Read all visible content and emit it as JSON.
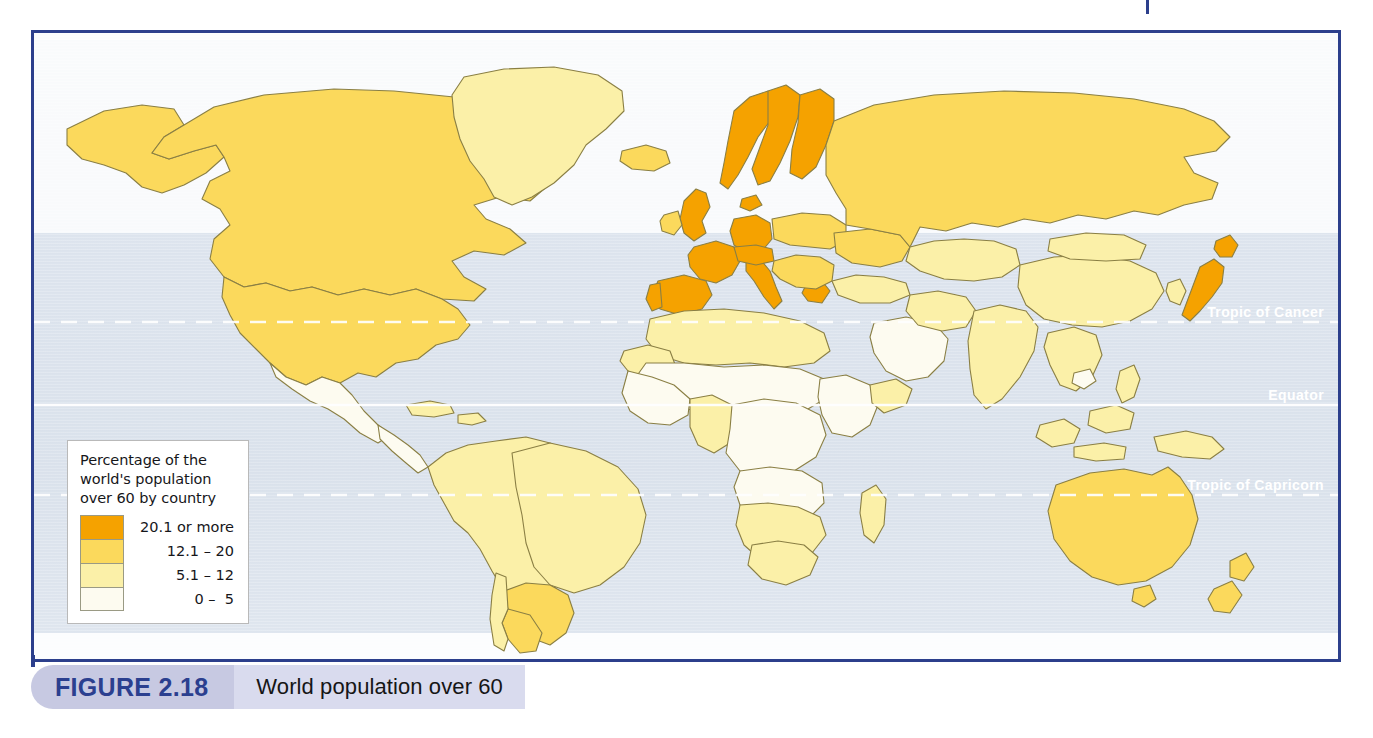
{
  "figure": {
    "number": "FIGURE 2.18",
    "caption": "World population over 60"
  },
  "legend": {
    "title": "Percentage of the world's population over 60 by country",
    "entries": [
      {
        "label": "20.1 or more",
        "color": "#F5A200",
        "min": 20.1,
        "max": null
      },
      {
        "label": "12.1 – 20",
        "color": "#FBD95C",
        "min": 12.1,
        "max": 20
      },
      {
        "label": "5.1 – 12",
        "color": "#FBF0A8",
        "min": 5.1,
        "max": 12
      },
      {
        "label": "0 –  5",
        "color": "#FDFBF0",
        "min": 0,
        "max": 5
      }
    ]
  },
  "map": {
    "type": "choropleth",
    "projection": "world-flat",
    "ocean_color": "#dde4ed",
    "land_stroke": "#8a7f44",
    "frame_color": "#2c3f8c",
    "graticule_labels": [
      {
        "name": "Tropic of Cancer",
        "text": "Tropic of Cancer",
        "style": "dashed"
      },
      {
        "name": "Equator",
        "text": "Equator",
        "style": "solid"
      },
      {
        "name": "Tropic of Capricorn",
        "text": "Tropic of Capricorn",
        "style": "dashed"
      }
    ],
    "regions": [
      {
        "name": "Canada",
        "tier": 1
      },
      {
        "name": "United States",
        "tier": 1
      },
      {
        "name": "Alaska",
        "tier": 1
      },
      {
        "name": "Greenland",
        "tier": 2
      },
      {
        "name": "Iceland",
        "tier": 1
      },
      {
        "name": "Mexico",
        "tier": 3
      },
      {
        "name": "Central America",
        "tier": 3
      },
      {
        "name": "Caribbean",
        "tier": 2
      },
      {
        "name": "Brazil",
        "tier": 2
      },
      {
        "name": "Argentina",
        "tier": 1
      },
      {
        "name": "Uruguay",
        "tier": 1
      },
      {
        "name": "Chile",
        "tier": 2
      },
      {
        "name": "Andean states",
        "tier": 2
      },
      {
        "name": "United Kingdom",
        "tier": 0
      },
      {
        "name": "Ireland",
        "tier": 1
      },
      {
        "name": "France",
        "tier": 0
      },
      {
        "name": "Spain",
        "tier": 0
      },
      {
        "name": "Portugal",
        "tier": 0
      },
      {
        "name": "Italy",
        "tier": 0
      },
      {
        "name": "Germany",
        "tier": 0
      },
      {
        "name": "Sweden",
        "tier": 0
      },
      {
        "name": "Finland",
        "tier": 0
      },
      {
        "name": "Norway",
        "tier": 0
      },
      {
        "name": "Denmark",
        "tier": 0
      },
      {
        "name": "Switzerland",
        "tier": 0
      },
      {
        "name": "Austria",
        "tier": 0
      },
      {
        "name": "Greece",
        "tier": 0
      },
      {
        "name": "Central Europe",
        "tier": 1
      },
      {
        "name": "Balkans",
        "tier": 1
      },
      {
        "name": "Russia",
        "tier": 1
      },
      {
        "name": "Ukraine",
        "tier": 1
      },
      {
        "name": "Turkey",
        "tier": 2
      },
      {
        "name": "North Africa",
        "tier": 2
      },
      {
        "name": "Sub-Saharan Africa",
        "tier": 3
      },
      {
        "name": "South Africa",
        "tier": 2
      },
      {
        "name": "Namibia",
        "tier": 2
      },
      {
        "name": "Botswana",
        "tier": 2
      },
      {
        "name": "Madagascar",
        "tier": 2
      },
      {
        "name": "Arabian Peninsula",
        "tier": 3
      },
      {
        "name": "India",
        "tier": 2
      },
      {
        "name": "China",
        "tier": 2
      },
      {
        "name": "Japan",
        "tier": 0
      },
      {
        "name": "South Korea",
        "tier": 2
      },
      {
        "name": "Southeast Asia",
        "tier": 2
      },
      {
        "name": "Indonesia",
        "tier": 2
      },
      {
        "name": "Australia",
        "tier": 1
      },
      {
        "name": "New Zealand",
        "tier": 1
      },
      {
        "name": "Papua New Guinea",
        "tier": 2
      }
    ]
  }
}
